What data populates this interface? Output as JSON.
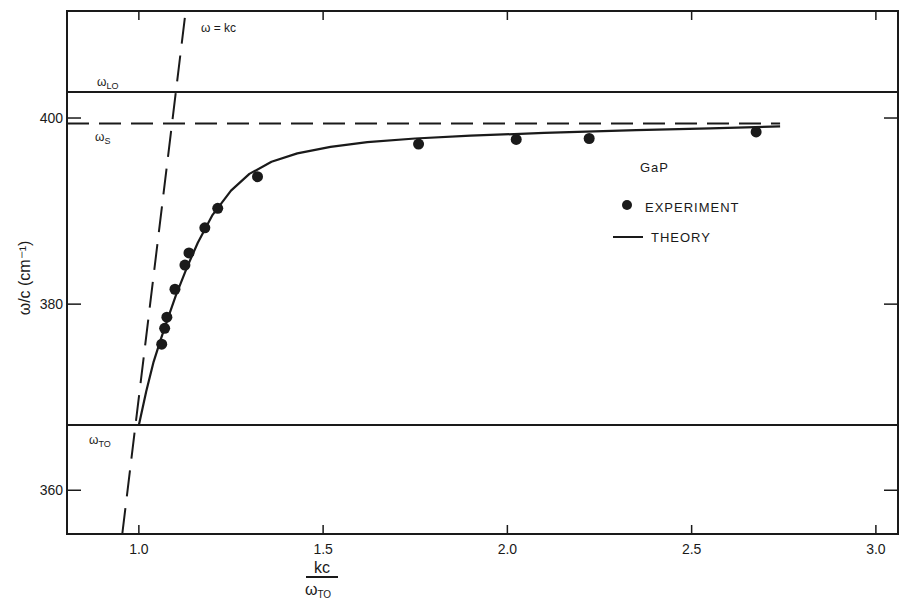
{
  "chart_data": {
    "type": "scatter",
    "title": "",
    "material_label": "GaP",
    "xlabel": "kc / ω_TO",
    "xlabel_numerator": "kc",
    "xlabel_denominator": "ω",
    "xlabel_denominator_sub": "TO",
    "ylabel": "ω/c  (cm⁻¹)",
    "xlim": [
      0.805,
      3.06
    ],
    "ylim": [
      355.3,
      411.5
    ],
    "grid": false,
    "x_ticks": [
      1.0,
      1.5,
      2.0,
      2.5,
      3.0
    ],
    "x_tick_labels": [
      "1.0",
      "1.5",
      "2.0",
      "2.5",
      "3.0"
    ],
    "y_ticks": [
      360,
      380,
      400
    ],
    "y_tick_labels": [
      "360",
      "380",
      "400"
    ],
    "legend": {
      "position": "right-center",
      "entries": [
        {
          "label": "EXPERIMENT",
          "marker": "filled-circle"
        },
        {
          "label": "THEORY",
          "marker": "solid-line"
        }
      ]
    },
    "reference_lines": [
      {
        "name": "ω_LO",
        "label_main": "ω",
        "label_sub": "LO",
        "y": 402.8,
        "style": "solid"
      },
      {
        "name": "ω_S",
        "label_main": "ω",
        "label_sub": "S",
        "y": 399.4,
        "style": "dashed",
        "x_end": 2.74
      },
      {
        "name": "ω_TO",
        "label_main": "ω",
        "label_sub": "TO",
        "y": 367.0,
        "style": "solid"
      }
    ],
    "light_line": {
      "label": "ω = kc",
      "style": "long-dashed",
      "points": [
        [
          0.955,
          355.3
        ],
        [
          1.127,
          411.5
        ]
      ]
    },
    "series": [
      {
        "name": "EXPERIMENT",
        "type": "scatter",
        "x": [
          1.062,
          1.07,
          1.076,
          1.098,
          1.125,
          1.136,
          1.179,
          1.214,
          1.322,
          1.759,
          2.024,
          2.222,
          2.675
        ],
        "y": [
          375.7,
          377.4,
          378.6,
          381.6,
          384.2,
          385.5,
          388.2,
          390.3,
          393.7,
          397.2,
          397.7,
          397.8,
          398.5
        ]
      },
      {
        "name": "THEORY",
        "type": "line",
        "x": [
          1.0,
          1.02,
          1.04,
          1.06,
          1.08,
          1.1,
          1.13,
          1.16,
          1.2,
          1.25,
          1.3,
          1.36,
          1.43,
          1.52,
          1.62,
          1.75,
          1.9,
          2.1,
          2.35,
          2.55,
          2.74
        ],
        "y": [
          367.0,
          370.6,
          373.8,
          376.3,
          378.6,
          380.9,
          383.9,
          386.6,
          389.6,
          392.2,
          394.0,
          395.3,
          396.2,
          396.9,
          397.4,
          397.8,
          398.1,
          398.4,
          398.7,
          398.9,
          399.1
        ]
      }
    ]
  },
  "colors": {
    "ink": "#1a1a1a",
    "background": "#ffffff"
  }
}
